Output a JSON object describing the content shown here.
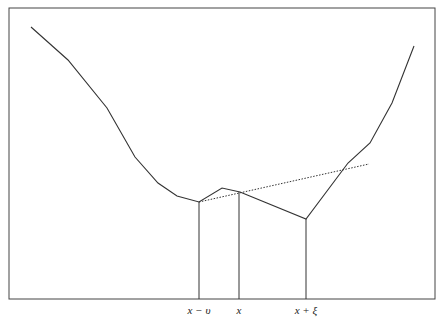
{
  "diagram": {
    "frame": {
      "x": 9,
      "y": 8,
      "width": 426,
      "height": 291
    },
    "curve_points": [
      [
        31,
        27
      ],
      [
        68,
        60
      ],
      [
        107,
        108
      ],
      [
        135,
        157
      ],
      [
        158,
        183
      ],
      [
        177,
        196
      ],
      [
        199,
        202
      ],
      [
        222,
        188
      ],
      [
        240,
        192
      ],
      [
        306,
        219
      ],
      [
        348,
        163
      ],
      [
        370,
        143
      ],
      [
        392,
        103
      ],
      [
        414,
        46
      ]
    ],
    "tangent_line": {
      "x1": 199,
      "y1": 202,
      "x2": 369,
      "y2": 164,
      "style": "dotted"
    },
    "verticals": [
      {
        "x": 199,
        "top": 202,
        "label": "x − υ"
      },
      {
        "x": 239,
        "top": 192,
        "label": "x"
      },
      {
        "x": 306,
        "top": 219,
        "label": "x + ξ"
      }
    ],
    "stroke_color": "#333333"
  },
  "labels": {
    "left": "x − υ",
    "mid": "x",
    "right": "x + ξ"
  }
}
